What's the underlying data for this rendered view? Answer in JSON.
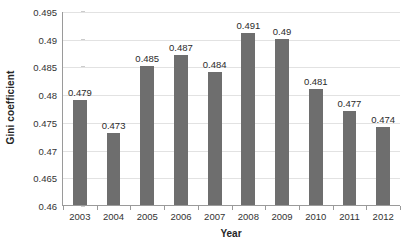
{
  "chart_data": {
    "type": "bar",
    "title": "",
    "xlabel": "Year",
    "ylabel": "Gini coefficient",
    "categories": [
      "2003",
      "2004",
      "2005",
      "2006",
      "2007",
      "2008",
      "2009",
      "2010",
      "2011",
      "2012"
    ],
    "values": [
      0.479,
      0.473,
      0.485,
      0.487,
      0.484,
      0.491,
      0.49,
      0.481,
      0.477,
      0.474
    ],
    "data_labels": [
      "0.479",
      "0.473",
      "0.485",
      "0.487",
      "0.484",
      "0.491",
      "0.49",
      "0.481",
      "0.477",
      "0.474"
    ],
    "ylim": [
      0.46,
      0.495
    ],
    "ytick_step": 0.005,
    "ytick_labels": [
      "0.495",
      "0.49",
      "0.485",
      "0.48",
      "0.475",
      "0.47",
      "0.465",
      "0.46"
    ],
    "ytick_values": [
      0.495,
      0.49,
      0.485,
      0.48,
      0.475,
      0.47,
      0.465,
      0.46
    ],
    "grid": true,
    "grid_axis": "y",
    "legend": false,
    "series": [
      {
        "name": "Gini coefficient",
        "color": "#6e6e6e",
        "values": [
          0.479,
          0.473,
          0.485,
          0.487,
          0.484,
          0.491,
          0.49,
          0.481,
          0.477,
          0.474
        ]
      }
    ],
    "colors": {
      "bar": "#6e6e6e",
      "gridline": "#e2e2e2",
      "axis": "#9a9a9a",
      "text": "#333333",
      "background": "#ffffff"
    }
  }
}
